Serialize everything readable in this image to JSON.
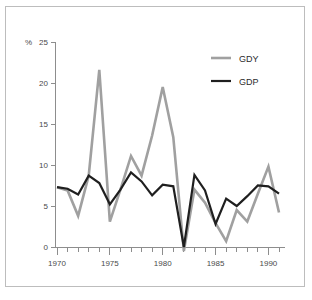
{
  "chart_data": {
    "type": "line",
    "title": "",
    "subtitle": "",
    "xlabel": "",
    "ylabel": "",
    "unit_label": "%",
    "grid": false,
    "legend_position": "top-right",
    "xlim": [
      1969.4,
      1991.6
    ],
    "ylim": [
      -1.0,
      25.5
    ],
    "xticks": [
      1970,
      1975,
      1980,
      1985,
      1990
    ],
    "xtick_labels": [
      "1970",
      "1975",
      "1980",
      "1985",
      "1990"
    ],
    "minor_xticks": [
      1971,
      1972,
      1973,
      1974,
      1976,
      1977,
      1978,
      1979,
      1981,
      1982,
      1983,
      1984,
      1986,
      1987,
      1988,
      1989,
      1991
    ],
    "yticks": [
      0,
      5,
      10,
      15,
      20,
      25
    ],
    "ytick_labels": [
      "0",
      "5",
      "10",
      "15",
      "20",
      "25"
    ],
    "x": [
      1970,
      1971,
      1972,
      1973,
      1974,
      1975,
      1976,
      1977,
      1978,
      1979,
      1980,
      1981,
      1982,
      1983,
      1984,
      1985,
      1986,
      1987,
      1988,
      1989,
      1990,
      1991
    ],
    "series": [
      {
        "name": "GDY",
        "color": "#a0a0a0",
        "width": 2.6,
        "values": [
          7.3,
          6.9,
          3.8,
          8.7,
          21.6,
          3.1,
          7.0,
          11.1,
          8.7,
          13.6,
          19.5,
          13.4,
          -0.5,
          7.0,
          5.4,
          2.9,
          0.7,
          4.5,
          3.1,
          6.5,
          9.8,
          4.2
        ]
      },
      {
        "name": "GDP",
        "color": "#1f1f1f",
        "width": 2.2,
        "values": [
          7.3,
          7.1,
          6.4,
          8.7,
          7.8,
          5.2,
          7.0,
          9.1,
          8.0,
          6.3,
          7.6,
          7.4,
          0.0,
          8.8,
          6.9,
          2.8,
          5.9,
          5.0,
          6.2,
          7.5,
          7.4,
          6.5
        ]
      }
    ]
  },
  "legend": {
    "entries": [
      {
        "label": "GDY",
        "color": "#a0a0a0"
      },
      {
        "label": "GDP",
        "color": "#1f1f1f"
      }
    ]
  },
  "colors": {
    "background": "#ffffff",
    "border": "#bdbdbd",
    "axis": "#8d8d8d",
    "text": "#4a4a4a",
    "gdy": "#a0a0a0",
    "gdp": "#1f1f1f"
  }
}
